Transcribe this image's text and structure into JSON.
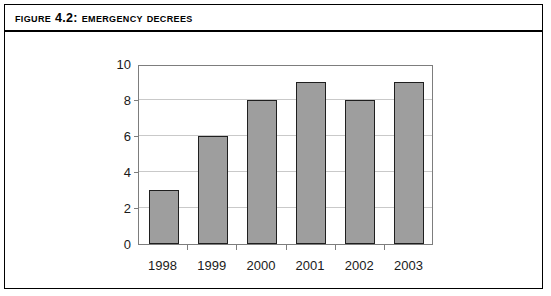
{
  "figure": {
    "title": "Figure 4.2: Emergency decrees",
    "border_color": "#000000",
    "background": "#ffffff"
  },
  "chart_data": {
    "type": "bar",
    "title": "Figure 4.2: Emergency decrees",
    "categories": [
      "1998",
      "1999",
      "2000",
      "2001",
      "2002",
      "2003"
    ],
    "values": [
      3,
      6,
      8,
      9,
      8,
      9
    ],
    "xlabel": "",
    "ylabel": "",
    "ylim": [
      0,
      10
    ],
    "yticks": [
      0,
      2,
      4,
      6,
      8,
      10
    ],
    "ytick_labels": [
      "0",
      "2",
      "4",
      "6",
      "8",
      "10"
    ],
    "grid": true,
    "grid_axis": "y",
    "legend": false,
    "bar_fill_color": "#9e9e9e",
    "bar_edge_color": "#1f1f1f",
    "gridline_color": "#c9c9c9",
    "axis_color": "#7d7d7d"
  }
}
